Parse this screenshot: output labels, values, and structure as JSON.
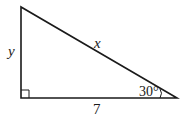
{
  "diagram": {
    "type": "right-triangle",
    "labels": {
      "vertical_leg": "y",
      "hypotenuse": "x",
      "horizontal_leg": "7",
      "angle": "30°"
    },
    "right_angle_marker": true,
    "colors": {
      "stroke": "#1a1a1a",
      "background": "#ffffff"
    }
  }
}
